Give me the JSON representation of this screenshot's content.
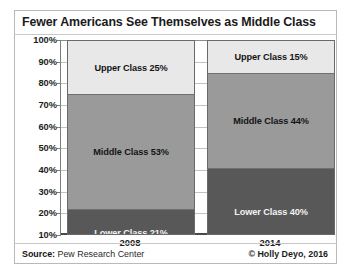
{
  "title": "Fewer Americans See Themselves as Middle Class",
  "footer": {
    "source_prefix": "Source:",
    "source_text": " Pew Research Center",
    "copyright": "© Holly Deyo, 2016"
  },
  "colors": {
    "upper_class": "#e8e8e8",
    "middle_class": "#9a9a9a",
    "lower_class": "#585858",
    "axis": "#4a4a4a",
    "gridline": "#c2c2c2",
    "text": "#1a1a1a"
  },
  "chart_data": {
    "type": "bar",
    "subtype": "stacked-column",
    "title": "Fewer Americans See Themselves as Middle Class",
    "xlabel": "",
    "ylabel": "",
    "categories": [
      "2008",
      "2014"
    ],
    "ylim": [
      10,
      100
    ],
    "ytick_labels": [
      "10%",
      "20%",
      "30%",
      "40%",
      "50%",
      "60%",
      "70%",
      "80%",
      "90%",
      "100%"
    ],
    "ytick_values": [
      10,
      20,
      30,
      40,
      50,
      60,
      70,
      80,
      90,
      100
    ],
    "grid": true,
    "legend": "none",
    "series": [
      {
        "name": "Lower Class",
        "values": [
          21,
          40
        ],
        "color": "#585858",
        "labels": [
          "Lower Class  21%",
          "Lower Class  40%"
        ]
      },
      {
        "name": "Middle Class",
        "values": [
          53,
          44
        ],
        "color": "#9a9a9a",
        "labels": [
          "Middle Class  53%",
          "Middle Class  44%"
        ]
      },
      {
        "name": "Upper Class",
        "values": [
          25,
          15
        ],
        "color": "#e8e8e8",
        "labels": [
          "Upper Class  25%",
          "Upper Class  15%"
        ]
      }
    ],
    "annotations": [
      "Source: Pew Research Center",
      "© Holly Deyo, 2016"
    ]
  }
}
